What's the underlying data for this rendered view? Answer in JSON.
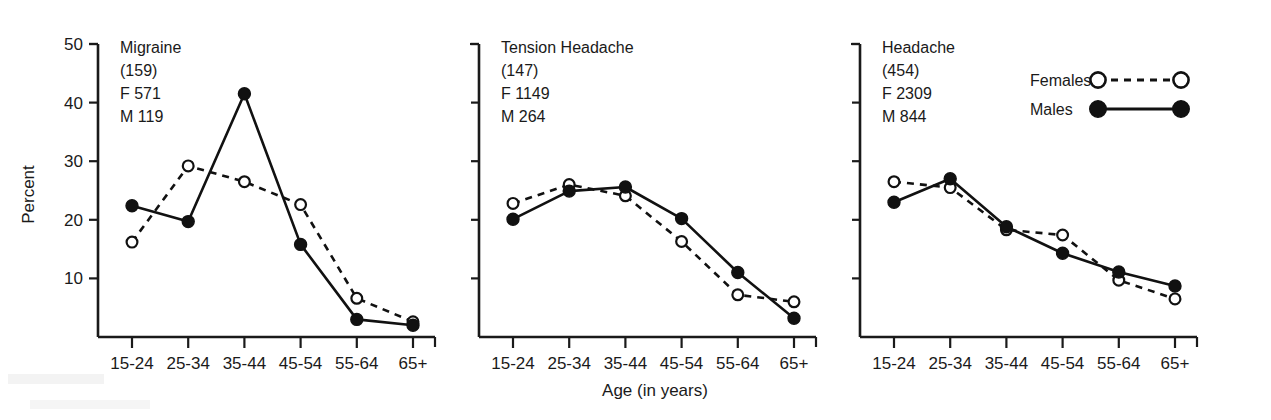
{
  "chart_data": {
    "type": "line",
    "title": "",
    "xlabel": "Age (in years)",
    "ylabel": "Percent",
    "categories": [
      "15-24",
      "25-34",
      "35-44",
      "45-54",
      "55-64",
      "65+"
    ],
    "ylim": [
      0,
      50
    ],
    "yticks": [
      10,
      20,
      30,
      40,
      50
    ],
    "grid": false,
    "legend_position": "top-right",
    "panels": [
      {
        "name": "migraine",
        "label_lines": [
          "Migraine",
          "(159)",
          "F 571",
          "M 119"
        ],
        "condition": "Migraine",
        "count": "(159)",
        "females_total": "F 571",
        "males_total": "M 119",
        "series": [
          {
            "name": "Females",
            "style": "dashed-open",
            "values": [
              16.2,
              29.2,
              26.5,
              22.6,
              6.6,
              2.6
            ]
          },
          {
            "name": "Males",
            "style": "solid-filled",
            "values": [
              22.4,
              19.7,
              41.5,
              15.8,
              3.0,
              2.0
            ]
          }
        ]
      },
      {
        "name": "tension-headache",
        "label_lines": [
          "Tension Headache",
          "(147)",
          "F 1149",
          "M 264"
        ],
        "condition": "Tension Headache",
        "count": "(147)",
        "females_total": "F 1149",
        "males_total": "M 264",
        "series": [
          {
            "name": "Females",
            "style": "dashed-open",
            "values": [
              22.8,
              26.0,
              24.1,
              16.3,
              7.2,
              6.0
            ]
          },
          {
            "name": "Males",
            "style": "solid-filled",
            "values": [
              20.1,
              24.9,
              25.6,
              20.2,
              11.0,
              3.2
            ]
          }
        ]
      },
      {
        "name": "headache",
        "label_lines": [
          "Headache",
          "(454)",
          "F 2309",
          "M 844"
        ],
        "condition": "Headache",
        "count": "(454)",
        "females_total": "F 2309",
        "males_total": "M 844",
        "series": [
          {
            "name": "Females",
            "style": "dashed-open",
            "values": [
              26.5,
              25.5,
              18.3,
              17.4,
              9.7,
              6.5
            ]
          },
          {
            "name": "Males",
            "style": "solid-filled",
            "values": [
              23.0,
              27.0,
              18.8,
              14.3,
              11.1,
              8.7
            ]
          }
        ]
      }
    ],
    "legend": [
      {
        "label": "Females",
        "marker": "open-circle",
        "line": "dashed"
      },
      {
        "label": "Males",
        "marker": "filled-circle",
        "line": "solid"
      }
    ]
  },
  "colors": {
    "ink": "#1a1a1a",
    "line": "#111111",
    "background": "#ffffff",
    "open_marker_fill": "#ffffff"
  }
}
